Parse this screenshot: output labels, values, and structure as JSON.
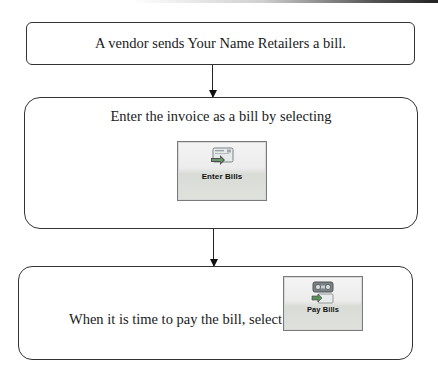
{
  "flowchart": {
    "steps": [
      {
        "text": "A vendor sends Your Name Retailers a bill."
      },
      {
        "text": "Enter the invoice as a bill by selecting",
        "button": {
          "label": "Enter Bills",
          "icon": "enter-bills-icon"
        }
      },
      {
        "text": "When it is time to pay the bill, select",
        "button": {
          "label": "Pay Bills",
          "icon": "pay-bills-icon"
        }
      }
    ],
    "arrows": [
      {
        "from": 0,
        "to": 1,
        "icon": "arrow-down-icon"
      },
      {
        "from": 1,
        "to": 2,
        "icon": "arrow-down-icon"
      }
    ]
  },
  "colors": {
    "border": "#333333",
    "text": "#1a1a1a",
    "button_top": "#f4f4f4",
    "button_bottom": "#dfe1dc",
    "icon_green": "#5b8f5a",
    "icon_gray": "#8a8f92"
  }
}
